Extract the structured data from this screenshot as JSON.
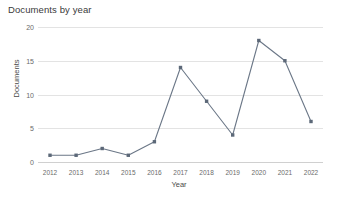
{
  "chart_data": {
    "type": "line",
    "title": "Documents by year",
    "xlabel": "Year",
    "ylabel": "Documents",
    "categories": [
      "2012",
      "2013",
      "2014",
      "2015",
      "2016",
      "2017",
      "2018",
      "2019",
      "2020",
      "2021",
      "2022"
    ],
    "values": [
      1,
      1,
      2,
      1,
      3,
      14,
      9,
      4,
      18,
      15,
      6
    ],
    "series": [
      {
        "name": "Documents",
        "values": [
          1,
          1,
          2,
          1,
          3,
          14,
          9,
          4,
          18,
          15,
          6
        ]
      }
    ],
    "yticks": [
      0,
      5,
      10,
      15,
      20
    ],
    "ylim": [
      0,
      20
    ],
    "xlim": [
      "2012",
      "2022"
    ],
    "grid": true,
    "legend": false,
    "markers": true,
    "line_color": "#6b7787",
    "marker_color": "#5c6878",
    "grid_color": "#e3e3e3",
    "axis_color": "#d0d0d0",
    "title_color": "#3a3a3a",
    "tick_color": "#6a6a6a",
    "background": "#ffffff"
  }
}
